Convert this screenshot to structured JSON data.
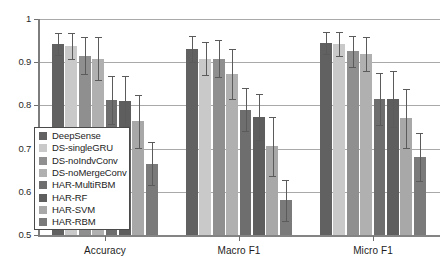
{
  "chart_data": {
    "type": "bar",
    "title": "",
    "xlabel": "",
    "ylabel": "",
    "ylim": [
      0.5,
      1.0
    ],
    "yticks": [
      "0.5",
      "0.6",
      "0.7",
      "0.8",
      "0.9",
      "1"
    ],
    "grid": true,
    "legend_position": "lower-left-inside",
    "categories": [
      "Accuracy",
      "Macro F1",
      "Micro F1"
    ],
    "series": [
      {
        "name": "DeepSense",
        "color": "#616161",
        "values": [
          0.942,
          0.93,
          0.944
        ],
        "errors": [
          0.025,
          0.03,
          0.026
        ]
      },
      {
        "name": "DS-singleGRU",
        "color": "#c9c9c9",
        "values": [
          0.938,
          0.908,
          0.942
        ],
        "errors": [
          0.03,
          0.038,
          0.027
        ]
      },
      {
        "name": "DS-noIndvConv",
        "color": "#8f8f8f",
        "values": [
          0.915,
          0.908,
          0.925
        ],
        "errors": [
          0.043,
          0.043,
          0.036
        ]
      },
      {
        "name": "DS-noMergeConv",
        "color": "#b0b0b0",
        "values": [
          0.908,
          0.872,
          0.919
        ],
        "errors": [
          0.05,
          0.058,
          0.04
        ]
      },
      {
        "name": "HAR-MultiRBM",
        "color": "#6e6e6e",
        "values": [
          0.812,
          0.79,
          0.815
        ],
        "errors": [
          0.055,
          0.05,
          0.06
        ]
      },
      {
        "name": "HAR-RF",
        "color": "#5e5e5e",
        "values": [
          0.81,
          0.773,
          0.814
        ],
        "errors": [
          0.058,
          0.053,
          0.065
        ]
      },
      {
        "name": "HAR-SVM",
        "color": "#a8a8a8",
        "values": [
          0.763,
          0.705,
          0.77
        ],
        "errors": [
          0.062,
          0.068,
          0.068
        ]
      },
      {
        "name": "HAR-RBM",
        "color": "#7a7a7a",
        "values": [
          0.665,
          0.58,
          0.68
        ],
        "errors": [
          0.05,
          0.048,
          0.055
        ]
      }
    ]
  }
}
